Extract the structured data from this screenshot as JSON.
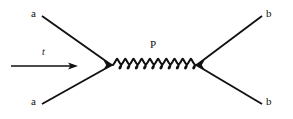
{
  "figure": {
    "kind": "feynman-diagram",
    "process": "a a -> b b",
    "background_color": "#ffffff",
    "ink_color": "#111111",
    "width": 293,
    "height": 119
  },
  "labels": {
    "incoming_top": "a",
    "incoming_bottom": "a",
    "outgoing_top": "b",
    "outgoing_bottom": "b",
    "propagator": "P",
    "time_axis": "t"
  },
  "chart_data": {
    "type": "diagram",
    "title": "",
    "nodes": [
      {
        "id": "v1",
        "name": "left-vertex",
        "x": 112,
        "y": 65,
        "marker": "arrowhead-right"
      },
      {
        "id": "v2",
        "name": "right-vertex",
        "x": 196,
        "y": 65,
        "marker": "arrowhead-left"
      }
    ],
    "edges": [
      {
        "id": "e1",
        "name": "incoming-top-leg",
        "style": "straight",
        "label": "a",
        "from": {
          "x": 42,
          "y": 16
        },
        "to": {
          "x": 112,
          "y": 65
        }
      },
      {
        "id": "e2",
        "name": "incoming-bottom-leg",
        "style": "straight",
        "label": "a",
        "from": {
          "x": 42,
          "y": 104
        },
        "to": {
          "x": 112,
          "y": 65
        }
      },
      {
        "id": "e3",
        "name": "outgoing-top-leg",
        "style": "straight",
        "label": "b",
        "from": {
          "x": 196,
          "y": 65
        },
        "to": {
          "x": 262,
          "y": 16
        }
      },
      {
        "id": "e4",
        "name": "outgoing-bottom-leg",
        "style": "straight",
        "label": "b",
        "from": {
          "x": 196,
          "y": 65
        },
        "to": {
          "x": 262,
          "y": 104
        }
      },
      {
        "id": "e5",
        "name": "propagator-coil",
        "style": "coil",
        "label": "P",
        "from": {
          "x": 113,
          "y": 65
        },
        "to": {
          "x": 195,
          "y": 65
        },
        "loops": 10
      }
    ],
    "annotations": [
      {
        "id": "time-arrow",
        "name": "time-direction-arrow",
        "label": "t",
        "from": {
          "x": 11,
          "y": 66
        },
        "to": {
          "x": 76,
          "y": 66
        },
        "direction": "right"
      }
    ]
  }
}
